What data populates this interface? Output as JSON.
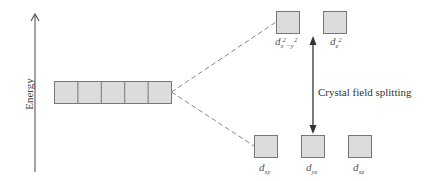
{
  "diagram": {
    "axis": {
      "label": "Energy",
      "direction": "up"
    },
    "degenerate_orbitals": {
      "count": 5,
      "fill": "#dcdcdc",
      "stroke": "#777777"
    },
    "splitting_label": "Crystal field splitting",
    "upper_set": [
      {
        "name": "d",
        "sub": "x",
        "sup_text": "2",
        "sub2": "−y",
        "sup2": "2",
        "plain": "dx²−y²"
      },
      {
        "name": "d",
        "sub": "z",
        "sup_text": "2",
        "plain": "dz²"
      }
    ],
    "lower_set": [
      {
        "name": "d",
        "sub": "xy",
        "plain": "dxy"
      },
      {
        "name": "d",
        "sub": "yz",
        "plain": "dyz"
      },
      {
        "name": "d",
        "sub": "xz",
        "plain": "dxz"
      }
    ],
    "colors": {
      "box_fill": "#dcdcdc",
      "box_stroke": "#777777",
      "line": "#888888",
      "arrow": "#333333"
    }
  }
}
